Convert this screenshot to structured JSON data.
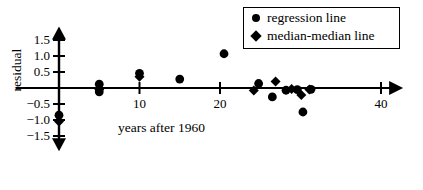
{
  "chart_data": {
    "type": "scatter",
    "title": "",
    "xlabel": "years after 1960",
    "ylabel": "residual",
    "xlim": [
      -2,
      42
    ],
    "ylim": [
      -1.85,
      1.8
    ],
    "grid": false,
    "x_ticks": [
      10,
      20,
      40
    ],
    "x_tick_labels": [
      "10",
      "20",
      "40"
    ],
    "y_ticks": [
      1.5,
      1.0,
      0.5,
      -0.5,
      -1.0,
      -1.5
    ],
    "y_tick_labels": [
      "1.5",
      "1.0",
      "0.5",
      "−0.5",
      "−1.0",
      "−1.5"
    ],
    "legend_position": "top-right",
    "series": [
      {
        "name": "regression line",
        "marker": "circle",
        "color": "#000000",
        "points": [
          {
            "x": 0,
            "y": -0.85
          },
          {
            "x": 5,
            "y": 0.12
          },
          {
            "x": 5,
            "y": -0.12
          },
          {
            "x": 10,
            "y": 0.46
          },
          {
            "x": 15,
            "y": 0.28
          },
          {
            "x": 20.5,
            "y": 1.07
          },
          {
            "x": 24.8,
            "y": 0.14
          },
          {
            "x": 26.5,
            "y": -0.28
          },
          {
            "x": 28.2,
            "y": -0.07
          },
          {
            "x": 29.6,
            "y": -0.05
          },
          {
            "x": 30.3,
            "y": -0.75
          },
          {
            "x": 31.3,
            "y": -0.04
          }
        ]
      },
      {
        "name": "median-median line",
        "marker": "diamond",
        "color": "#000000",
        "points": [
          {
            "x": 0,
            "y": -1.05
          },
          {
            "x": 5,
            "y": -0.05
          },
          {
            "x": 10,
            "y": 0.35
          },
          {
            "x": 24.2,
            "y": -0.08
          },
          {
            "x": 26.9,
            "y": 0.2
          },
          {
            "x": 28.9,
            "y": -0.03
          },
          {
            "x": 30.1,
            "y": -0.22
          },
          {
            "x": 31.1,
            "y": -0.05
          }
        ]
      }
    ]
  },
  "axes": {
    "x_axis_name": "x-axis",
    "y_axis_name": "y-axis"
  }
}
